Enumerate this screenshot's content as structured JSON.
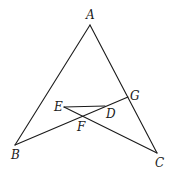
{
  "diagram": {
    "type": "geometry",
    "points": {
      "A": {
        "label": "A",
        "x": 90,
        "y": 25,
        "lx": 86,
        "ly": 19
      },
      "B": {
        "label": "B",
        "x": 15,
        "y": 145,
        "lx": 11,
        "ly": 159
      },
      "C": {
        "label": "C",
        "x": 157,
        "y": 153,
        "lx": 155,
        "ly": 167
      },
      "G": {
        "label": "G",
        "x": 128,
        "y": 97,
        "lx": 130,
        "ly": 100
      },
      "E": {
        "label": "E",
        "x": 64,
        "y": 107,
        "lx": 54,
        "ly": 111
      },
      "D": {
        "label": "D",
        "x": 105,
        "y": 106,
        "lx": 106,
        "ly": 118
      },
      "F": {
        "label": "F",
        "x": 82,
        "y": 115,
        "lx": 77,
        "ly": 131
      }
    },
    "segments": [
      {
        "name": "AB",
        "from": "A",
        "to": "B"
      },
      {
        "name": "AC",
        "from": "A",
        "to": "C"
      },
      {
        "name": "BG",
        "from": "B",
        "to": "G"
      },
      {
        "name": "EC",
        "from": "E",
        "to": "C"
      },
      {
        "name": "ED",
        "from": "E",
        "to": "D"
      }
    ],
    "colors": {
      "stroke": "#1a1a1a",
      "background": "#ffffff"
    }
  }
}
